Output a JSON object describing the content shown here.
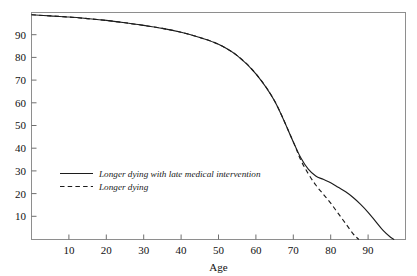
{
  "chart_data": {
    "type": "line",
    "title": "",
    "xlabel": "Age",
    "ylabel": "",
    "xlim": [
      0,
      100
    ],
    "ylim": [
      0,
      100
    ],
    "grid": false,
    "legend_position": "center-left",
    "xticks": [
      10,
      20,
      30,
      40,
      50,
      60,
      70,
      80,
      90
    ],
    "yticks": [
      10,
      20,
      30,
      40,
      50,
      60,
      70,
      80,
      90
    ],
    "xtick_labels": [
      "10",
      "20",
      "30",
      "40",
      "50",
      "60",
      "70",
      "80",
      "90"
    ],
    "ytick_labels": [
      "10",
      "20",
      "30",
      "40",
      "50",
      "60",
      "70",
      "80",
      "90"
    ],
    "series": [
      {
        "name": "Longer dying with late medical intervention",
        "style": "solid",
        "color": "#1c1c1c",
        "x": [
          0,
          5,
          10,
          15,
          20,
          25,
          30,
          35,
          40,
          45,
          50,
          55,
          60,
          65,
          70,
          72,
          74,
          76,
          78,
          80,
          82,
          84,
          86,
          88,
          90,
          92,
          94,
          96,
          97
        ],
        "values": [
          99,
          98.5,
          98,
          97.3,
          96.5,
          95.5,
          94.3,
          93,
          91.3,
          89,
          86,
          81,
          73,
          61,
          43,
          36,
          31,
          28,
          26.5,
          25,
          23,
          21,
          18.5,
          15.5,
          12,
          8,
          4,
          1,
          0
        ]
      },
      {
        "name": "Longer dying",
        "style": "dashed",
        "color": "#1c1c1c",
        "x": [
          0,
          5,
          10,
          15,
          20,
          25,
          30,
          35,
          40,
          45,
          50,
          55,
          60,
          65,
          70,
          72,
          74,
          76,
          78,
          80,
          82,
          84,
          86,
          87.5
        ],
        "values": [
          99,
          98.5,
          98,
          97.3,
          96.5,
          95.5,
          94.3,
          93,
          91.3,
          89,
          86,
          81,
          73,
          61,
          43,
          35,
          29,
          24,
          20,
          16,
          11.5,
          7,
          2.5,
          0
        ]
      }
    ]
  }
}
